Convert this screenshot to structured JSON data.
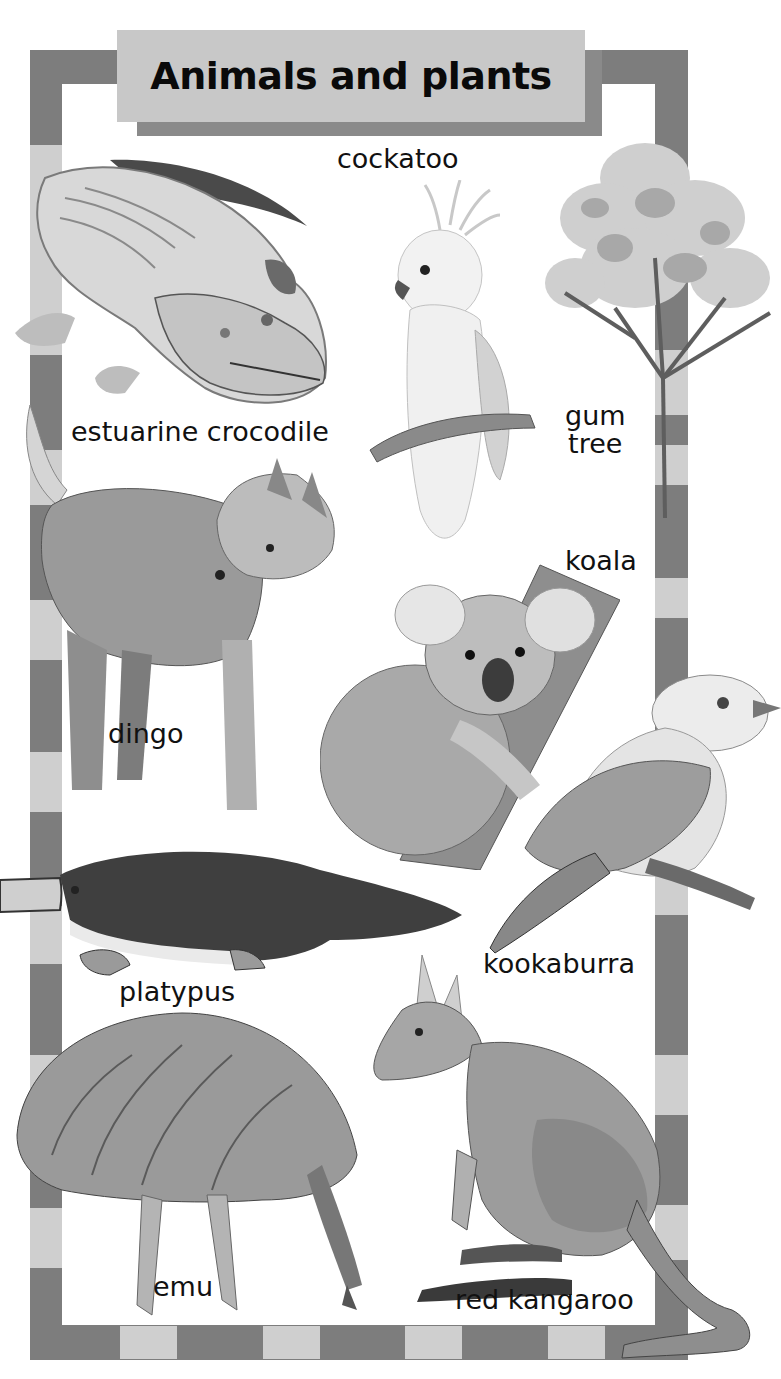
{
  "title": "Animals and plants",
  "labels": {
    "cockatoo": "cockatoo",
    "estuarine_crocodile": "estuarine crocodile",
    "gum_tree_line1": "gum",
    "gum_tree_line2": "tree",
    "koala": "koala",
    "dingo": "dingo",
    "platypus": "platypus",
    "kookaburra": "kookaburra",
    "emu": "emu",
    "red_kangaroo": "red kangaroo"
  },
  "colors": {
    "border_dark": "#7d7d7d",
    "border_light": "#cfcfcf",
    "banner_fill": "#c8c8c8",
    "banner_shadow": "#8a8a8a",
    "background": "#ffffff",
    "text": "#111111"
  },
  "illustrations": [
    "estuarine crocodile",
    "cockatoo",
    "gum tree",
    "dingo",
    "koala",
    "kookaburra",
    "platypus",
    "emu",
    "red kangaroo"
  ]
}
